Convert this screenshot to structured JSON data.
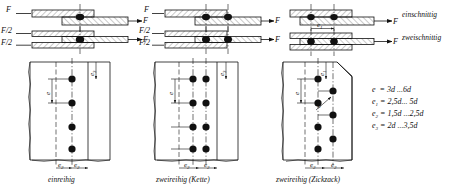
{
  "figure": {
    "shear_cases": [
      {
        "id": "single",
        "label": "einschnittig",
        "force_labels": [
          "F",
          "F"
        ]
      },
      {
        "id": "double",
        "label": "zweischnittig",
        "force_labels": [
          "F/2",
          "F/2",
          "F"
        ]
      }
    ],
    "pitch_detail_label": "e1",
    "panels": [
      {
        "id": "einreihig",
        "caption": "einreihig",
        "rows": 4,
        "cols": 1,
        "pattern": "inline",
        "dims": {
          "vertical_spacing": "e",
          "edge_top": "e3",
          "bottom_left": "e2",
          "bottom_right": "e2"
        }
      },
      {
        "id": "zweireihig-kette",
        "caption": "zweireihig (Kette)",
        "rows": 4,
        "cols": 2,
        "pattern": "chain",
        "dims": {
          "vertical_spacing": "e",
          "edge_top": "e3",
          "bottom_left": "e2",
          "bottom_right": "e2"
        }
      },
      {
        "id": "zweireihig-zickzack",
        "caption": "zweireihig (Zickzack)",
        "rows": 4,
        "cols": 2,
        "pattern": "staggered",
        "dims": {
          "vertical_spacing": "e",
          "diagonal_spacing": "e",
          "edge_top": "e1",
          "bottom_left": "e2",
          "bottom_right": "e2"
        }
      }
    ],
    "formulas": [
      {
        "symbol": "e",
        "sub": "",
        "value": "= 3d ...6d"
      },
      {
        "symbol": "e",
        "sub": "1",
        "value": "= 2,5d... 5d"
      },
      {
        "symbol": "e",
        "sub": "2",
        "value": "= 1,5d ...2,5d"
      },
      {
        "symbol": "e",
        "sub": "3",
        "value": "= 2d ...3,5d"
      }
    ],
    "colors": {
      "ink": "#111111",
      "paper": "#ffffff"
    }
  }
}
